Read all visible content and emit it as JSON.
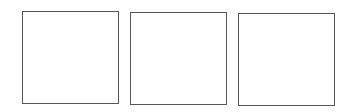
{
  "diagram": {
    "background": "#ffffff",
    "border_color": "#555555",
    "boxes": [
      {
        "label": "",
        "left": 22,
        "top": 11,
        "width": 97,
        "height": 93
      },
      {
        "label": "",
        "left": 130,
        "top": 12,
        "width": 97,
        "height": 93
      },
      {
        "label": "",
        "left": 238,
        "top": 13,
        "width": 97,
        "height": 93
      }
    ]
  }
}
